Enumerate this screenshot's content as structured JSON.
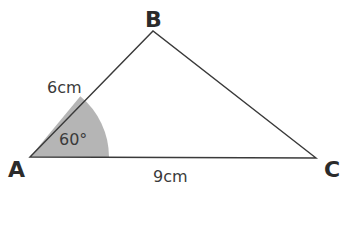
{
  "diagram": {
    "type": "triangle",
    "vertices": [
      {
        "label": "A"
      },
      {
        "label": "B"
      },
      {
        "label": "C"
      }
    ],
    "sides": {
      "AB": "6cm",
      "AC": "9cm"
    },
    "angle_A": "60°",
    "colors": {
      "line": "#3a3a3a",
      "angle_fill": "#b5b5b5",
      "background": "#ffffff"
    }
  }
}
